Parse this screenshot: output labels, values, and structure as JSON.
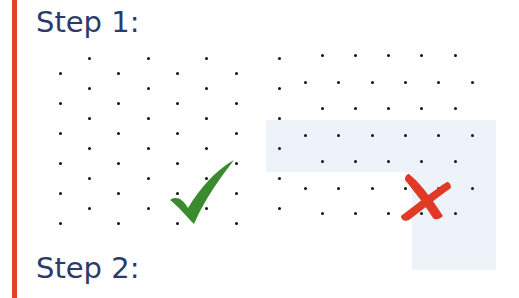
{
  "colors": {
    "accent_bar": "#e0432b",
    "heading": "#2b3a6b",
    "check": "#3a8a2e",
    "cross": "#e03a26",
    "shade": "#eef3fa"
  },
  "steps": [
    {
      "label": "Step 1:"
    },
    {
      "label": "Step 2:"
    }
  ],
  "diagram": {
    "left_grid": {
      "type": "triangular-dot-lattice",
      "verdict": "correct",
      "verdict_icon": "check-icon"
    },
    "right_grid": {
      "type": "irregular-dot-lattice",
      "verdict": "incorrect",
      "verdict_icon": "cross-icon"
    }
  }
}
